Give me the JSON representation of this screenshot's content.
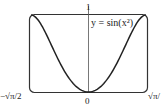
{
  "chart_data": {
    "type": "line",
    "title": "",
    "series": [
      {
        "name": "y = sin(x^2)",
        "label": "y = sin(x²)",
        "function": "sin(x^2)",
        "x": [
          -1.2533,
          -1.0,
          -0.75,
          -0.5,
          -0.25,
          0,
          0.25,
          0.5,
          0.75,
          1.0,
          1.2533
        ],
        "values": [
          1.0,
          0.8415,
          0.5333,
          0.2474,
          0.0625,
          0,
          0.0625,
          0.2474,
          0.5333,
          0.8415,
          1.0
        ]
      }
    ],
    "xlabel": "",
    "ylabel": "",
    "xlim": [
      -1.2533,
      1.2533
    ],
    "ylim": [
      0,
      1
    ],
    "x_tick_labels": [
      "-√π/2",
      "0",
      "√π/2"
    ],
    "y_tick_labels": [
      "1"
    ],
    "grid": false,
    "legend_position": "none"
  },
  "labels": {
    "curve": "y = sin(x²)",
    "y_max": "1",
    "x_min": "−√π/2",
    "x_zero": "0",
    "x_max": "√π/"
  }
}
